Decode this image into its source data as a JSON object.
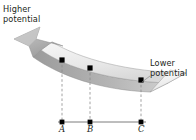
{
  "figure": {
    "type": "physics-potential-diagram",
    "background_color": "#ffffff",
    "labels": {
      "higher_line1": "Higher",
      "higher_line2": "potential",
      "lower_line1": "Lower",
      "lower_line2": "potential"
    },
    "colors": {
      "ribbon_top": "#eaeaea",
      "ribbon_top_light": "#f4f4f4",
      "ribbon_edge": "#bcbcbc",
      "ribbon_side": "#9f9f9f",
      "arrowhead": "#b4b4b4",
      "outline": "#8a8a8a",
      "axis": "#6d6d6d",
      "dash": "#8a8a8a",
      "marker": "#000000",
      "text": "#231f20"
    },
    "axis": {
      "x_start": 58,
      "x_end": 146,
      "y": 122
    },
    "points": [
      {
        "label": "A",
        "x": 62,
        "surface_y": 60,
        "axis_y": 122,
        "label_x": 59,
        "label_y": 125
      },
      {
        "label": "B",
        "x": 90,
        "surface_y": 68,
        "axis_y": 122,
        "label_x": 87,
        "label_y": 125
      },
      {
        "label": "C",
        "x": 141,
        "surface_y": 80,
        "axis_y": 122,
        "label_x": 138,
        "label_y": 125
      }
    ],
    "arrow": {
      "direction": "up-left",
      "meaning": "increasing-potential",
      "tip_x": 14,
      "tip_y": 39
    }
  }
}
